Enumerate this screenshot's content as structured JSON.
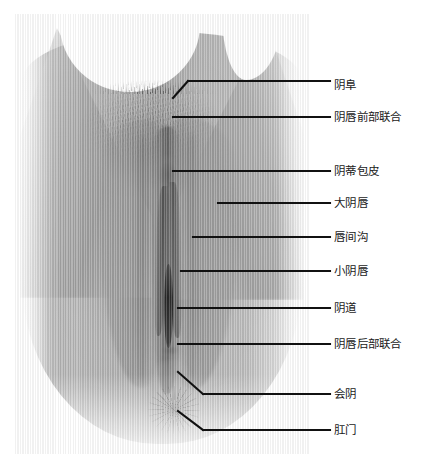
{
  "figure": {
    "type": "anatomical-labeled-photograph",
    "image_style": "grayscale photograph with vertical scanline texture",
    "colors": {
      "background": "#ffffff",
      "leader_line": "#111111",
      "label_text": "#1a1a1a",
      "skin_mid": "#a8a8a8",
      "skin_dark": "#6e6e6e",
      "skin_light": "#d6d6d6"
    }
  },
  "annotations": [
    {
      "id": "mons-pubis",
      "label": "阴阜",
      "label_x": 334,
      "label_y": 80,
      "anchor_x": 173,
      "anchor_y": 98,
      "elbow_x": 188,
      "elbow_y": 81,
      "line_end_x": 330,
      "line_end_y": 81,
      "has_elbow": true
    },
    {
      "id": "anterior-labial-commissure",
      "label": "阴唇前部联合",
      "label_x": 334,
      "label_y": 112,
      "anchor_x": 173,
      "anchor_y": 117,
      "elbow_x": 173,
      "elbow_y": 117,
      "line_end_x": 330,
      "line_end_y": 117,
      "has_elbow": false
    },
    {
      "id": "clitoral-hood",
      "label": "阴蒂包皮",
      "label_x": 334,
      "label_y": 166,
      "anchor_x": 173,
      "anchor_y": 171,
      "elbow_x": 173,
      "elbow_y": 171,
      "line_end_x": 330,
      "line_end_y": 171,
      "has_elbow": false
    },
    {
      "id": "labia-majora",
      "label": "大阴唇",
      "label_x": 334,
      "label_y": 198,
      "anchor_x": 218,
      "anchor_y": 203,
      "elbow_x": 218,
      "elbow_y": 203,
      "line_end_x": 330,
      "line_end_y": 203,
      "has_elbow": false
    },
    {
      "id": "interlabial-sulcus",
      "label": "唇间沟",
      "label_x": 334,
      "label_y": 232,
      "anchor_x": 193,
      "anchor_y": 237,
      "elbow_x": 193,
      "elbow_y": 237,
      "line_end_x": 330,
      "line_end_y": 237,
      "has_elbow": false
    },
    {
      "id": "labia-minora",
      "label": "小阴唇",
      "label_x": 334,
      "label_y": 266,
      "anchor_x": 181,
      "anchor_y": 271,
      "elbow_x": 181,
      "elbow_y": 271,
      "line_end_x": 330,
      "line_end_y": 271,
      "has_elbow": false
    },
    {
      "id": "vagina",
      "label": "阴道",
      "label_x": 334,
      "label_y": 303,
      "anchor_x": 178,
      "anchor_y": 308,
      "elbow_x": 178,
      "elbow_y": 308,
      "line_end_x": 330,
      "line_end_y": 308,
      "has_elbow": false
    },
    {
      "id": "posterior-labial-commissure",
      "label": "阴唇后部联合",
      "label_x": 334,
      "label_y": 339,
      "anchor_x": 178,
      "anchor_y": 344,
      "elbow_x": 178,
      "elbow_y": 344,
      "line_end_x": 330,
      "line_end_y": 344,
      "has_elbow": false
    },
    {
      "id": "perineum",
      "label": "会阴",
      "label_x": 334,
      "label_y": 389,
      "anchor_x": 178,
      "anchor_y": 372,
      "elbow_x": 203,
      "elbow_y": 394,
      "line_end_x": 330,
      "line_end_y": 394,
      "has_elbow": true
    },
    {
      "id": "anus",
      "label": "肛门",
      "label_x": 334,
      "label_y": 425,
      "anchor_x": 178,
      "anchor_y": 411,
      "elbow_x": 203,
      "elbow_y": 430,
      "line_end_x": 330,
      "line_end_y": 430,
      "has_elbow": true
    }
  ]
}
